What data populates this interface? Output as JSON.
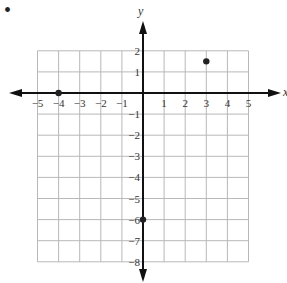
{
  "chart_data": {
    "type": "scatter",
    "title": "",
    "xlabel": "x",
    "ylabel": "y",
    "xlim": [
      -5,
      5
    ],
    "ylim": [
      -8,
      2
    ],
    "grid": true,
    "x_ticks": [
      "-5",
      "-4",
      "-3",
      "-2",
      "-1",
      "1",
      "2",
      "3",
      "4",
      "5"
    ],
    "y_ticks": [
      "2",
      "1",
      "-1",
      "-2",
      "-3",
      "-4",
      "-5",
      "-6",
      "-7",
      "-8"
    ],
    "points": [
      {
        "x": -4,
        "y": 0
      },
      {
        "x": 3,
        "y": 1.5
      },
      {
        "x": 0,
        "y": -6
      }
    ],
    "colors": {
      "axis": "#111111",
      "grid": "#b8b8b8",
      "point": "#222222"
    }
  },
  "marker": "•"
}
